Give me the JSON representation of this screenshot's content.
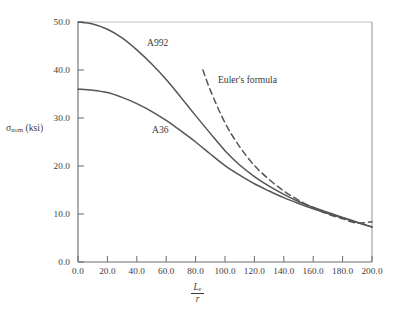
{
  "chart_data": {
    "type": "line",
    "title": "",
    "xlabel": "Le/r",
    "ylabel": "sigma_nom (ksi)",
    "xlim": [
      0,
      200
    ],
    "ylim": [
      0,
      50
    ],
    "xticks": [
      "0.0",
      "20.0",
      "40.0",
      "60.0",
      "80.0",
      "100.0",
      "120.0",
      "140.0",
      "160.0",
      "180.0",
      "200.0"
    ],
    "yticks": [
      "0.0",
      "10.0",
      "20.0",
      "30.0",
      "40.0",
      "50.0"
    ],
    "xtick_values": [
      0,
      20,
      40,
      60,
      80,
      100,
      120,
      140,
      160,
      180,
      200
    ],
    "ytick_values": [
      0,
      10,
      20,
      30,
      40,
      50
    ],
    "grid": false,
    "legend": "none",
    "series": [
      {
        "name": "A992",
        "style": "solid",
        "color": "#555555",
        "x": [
          0,
          10,
          20,
          30,
          40,
          50,
          60,
          70,
          80,
          90,
          100,
          110,
          120,
          130,
          140,
          150,
          160,
          170,
          180,
          190,
          200
        ],
        "values": [
          50.0,
          49.6,
          48.5,
          46.7,
          44.2,
          41.3,
          38.0,
          34.3,
          30.5,
          26.8,
          23.2,
          20.2,
          17.8,
          15.8,
          14.1,
          12.6,
          11.4,
          10.3,
          9.3,
          8.3,
          7.3
        ]
      },
      {
        "name": "A36",
        "style": "solid",
        "color": "#555555",
        "x": [
          0,
          10,
          20,
          30,
          40,
          50,
          60,
          70,
          80,
          90,
          100,
          110,
          120,
          130,
          140,
          150,
          160,
          170,
          180,
          190,
          200
        ],
        "values": [
          36.0,
          35.8,
          35.3,
          34.3,
          33.0,
          31.4,
          29.5,
          27.3,
          25.0,
          22.5,
          20.1,
          18.1,
          16.3,
          14.8,
          13.4,
          12.2,
          11.1,
          10.1,
          9.2,
          8.2,
          7.3
        ]
      },
      {
        "name": "Euler's formula",
        "style": "dashed",
        "color": "#555555",
        "x": [
          85,
          90,
          100,
          110,
          120,
          130,
          140,
          150,
          160,
          170,
          180,
          190,
          200
        ],
        "values": [
          40.0,
          35.8,
          29.0,
          24.0,
          20.1,
          17.2,
          14.8,
          12.9,
          11.3,
          10.0,
          9.0,
          8.1,
          8.4
        ]
      }
    ],
    "annotations": [
      {
        "text": "A992",
        "x_px": 147,
        "y_px": 37
      },
      {
        "text": "A36",
        "x_px": 152,
        "y_px": 124
      },
      {
        "text": "Euler's formula",
        "x_px": 218,
        "y_px": 74
      }
    ]
  },
  "axis": {
    "ylabel_sigma": "σ",
    "ylabel_sub": "nom",
    "ylabel_unit": " (ksi)",
    "xlabel_num": "L",
    "xlabel_num_sub": "e",
    "xlabel_den": "r"
  },
  "colors": {
    "curve": "#555555",
    "axis": "#4a4a4a",
    "text": "#3a3a3a",
    "background": "#ffffff"
  }
}
